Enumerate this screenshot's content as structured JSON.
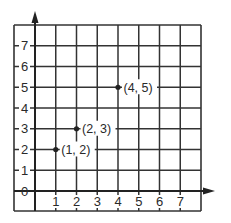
{
  "chart_data": {
    "type": "scatter",
    "title": "",
    "xlabel": "",
    "ylabel": "",
    "xlim": [
      0,
      8
    ],
    "ylim": [
      0,
      8
    ],
    "grid": true,
    "x_ticks": [
      1,
      2,
      3,
      4,
      5,
      6,
      7
    ],
    "y_ticks": [
      0,
      1,
      2,
      3,
      4,
      5,
      6,
      7
    ],
    "points": [
      {
        "x": 1,
        "y": 2,
        "label": "(1, 2)"
      },
      {
        "x": 2,
        "y": 3,
        "label": "(2, 3)"
      },
      {
        "x": 4,
        "y": 5,
        "label": "(4, 5)"
      }
    ],
    "x_tick_labels": [
      "1",
      "2",
      "3",
      "4",
      "5",
      "6",
      "7"
    ],
    "y_tick_labels": [
      "0",
      "1",
      "2",
      "3",
      "4",
      "5",
      "6",
      "7"
    ]
  },
  "colors": {
    "line": "#333333",
    "background": "#ffffff",
    "point": "#222222"
  }
}
